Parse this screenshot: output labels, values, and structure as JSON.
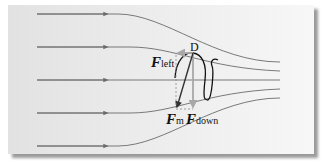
{
  "diagram": {
    "type": "magnetic-mirror-force-diagram",
    "point_label": "D",
    "forces": [
      {
        "symbol": "F",
        "subscript": "left",
        "direction": "left"
      },
      {
        "symbol": "F",
        "subscript": "down",
        "direction": "down"
      },
      {
        "symbol": "F",
        "subscript": "m",
        "direction": "down-left (resultant)"
      }
    ],
    "field_lines": 5,
    "field_direction": "left-to-right, converging",
    "colors": {
      "field_line": "#6b6b6b",
      "arrow_gray": "#a8a8a8",
      "helix": "#111111",
      "force_resultant": "#333333"
    }
  }
}
